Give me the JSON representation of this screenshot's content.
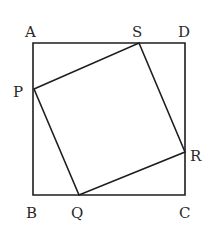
{
  "figure": {
    "outer_square": {
      "name": "ABCD",
      "vertices": {
        "A": [
          33,
          43
        ],
        "B": [
          33,
          195
        ],
        "C": [
          185,
          195
        ],
        "D": [
          185,
          43
        ]
      }
    },
    "inner_square": {
      "name": "PQRS",
      "vertices": {
        "P": [
          34,
          89
        ],
        "Q": [
          79,
          195
        ],
        "R": [
          185,
          152
        ],
        "S": [
          139,
          43
        ]
      }
    },
    "labels": [
      {
        "text": "A",
        "x": 25,
        "y": 37
      },
      {
        "text": "S",
        "x": 132,
        "y": 37
      },
      {
        "text": "D",
        "x": 178,
        "y": 37
      },
      {
        "text": "P",
        "x": 13,
        "y": 97
      },
      {
        "text": "R",
        "x": 190,
        "y": 161
      },
      {
        "text": "B",
        "x": 26,
        "y": 218
      },
      {
        "text": "Q",
        "x": 71,
        "y": 218
      },
      {
        "text": "C",
        "x": 179,
        "y": 218
      }
    ],
    "colors": {
      "stroke": "#1e1e1e",
      "text": "#2a2a2a",
      "background": "#ffffff"
    }
  }
}
